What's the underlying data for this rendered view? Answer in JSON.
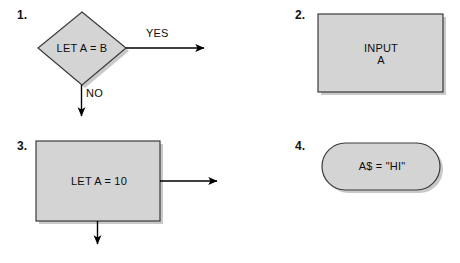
{
  "page": {
    "background_color": "#ffffff",
    "shape_fill_color": "#d4d4d4",
    "shape_border_color": "#3a3a3a",
    "shadow_color": "#9a9a9a",
    "text_color": "#0c0c0c",
    "arrow_color": "#000000"
  },
  "items": [
    {
      "number": "1.",
      "shape": "diamond",
      "shape_name": "decision",
      "text": "LET A = B",
      "connectors": [
        {
          "label": "YES",
          "direction": "right"
        },
        {
          "label": "NO",
          "direction": "down"
        }
      ]
    },
    {
      "number": "2.",
      "shape": "rectangle",
      "shape_name": "process",
      "text": "INPUT\nA",
      "connectors": []
    },
    {
      "number": "3.",
      "shape": "rectangle",
      "shape_name": "process",
      "text": "LET A = 10",
      "connectors": [
        {
          "label": "",
          "direction": "right"
        },
        {
          "label": "",
          "direction": "down"
        }
      ]
    },
    {
      "number": "4.",
      "shape": "stadium",
      "shape_name": "terminator",
      "text": "A$ = \"HI\"",
      "connectors": []
    }
  ],
  "labels": {
    "yes": "YES",
    "no": "NO"
  }
}
